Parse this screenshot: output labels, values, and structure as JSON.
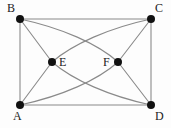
{
  "diagram": {
    "type": "graph-diagram",
    "background_color": "#fdfdfd",
    "edge_color": "#8a8a8a",
    "vertex_color": "#111111",
    "label_color": "#222222",
    "width": 171,
    "height": 128,
    "vertices": [
      {
        "id": "A",
        "label": "A",
        "x": 20,
        "y": 105,
        "radius": 4,
        "label_x": 13,
        "label_y": 110
      },
      {
        "id": "B",
        "label": "B",
        "x": 20,
        "y": 19,
        "radius": 4,
        "label_x": 7,
        "label_y": 2
      },
      {
        "id": "C",
        "label": "C",
        "x": 151,
        "y": 19,
        "radius": 4,
        "label_x": 155,
        "label_y": 2
      },
      {
        "id": "D",
        "label": "D",
        "x": 151,
        "y": 105,
        "radius": 4,
        "label_x": 155,
        "label_y": 110
      },
      {
        "id": "E",
        "label": "E",
        "x": 52,
        "y": 62,
        "radius": 4,
        "label_x": 59,
        "label_y": 56
      },
      {
        "id": "F",
        "label": "F",
        "x": 118,
        "y": 62,
        "radius": 4,
        "label_x": 103,
        "label_y": 56
      }
    ],
    "edges": [
      {
        "id": "edge-b-c",
        "from": "B",
        "to": "C",
        "shape": "straight",
        "path": "M 20 19 L 151 19"
      },
      {
        "id": "edge-a-d",
        "from": "A",
        "to": "D",
        "shape": "straight",
        "path": "M 20 105 L 151 105"
      },
      {
        "id": "edge-a-b",
        "from": "A",
        "to": "B",
        "shape": "straight",
        "path": "M 20 19 L 20 105"
      },
      {
        "id": "edge-c-d",
        "from": "C",
        "to": "D",
        "shape": "straight",
        "path": "M 151 19 L 151 105"
      },
      {
        "id": "edge-b-e",
        "from": "B",
        "to": "E",
        "shape": "straight",
        "path": "M 20 19 L 52 62"
      },
      {
        "id": "edge-a-e",
        "from": "A",
        "to": "E",
        "shape": "straight",
        "path": "M 20 105 L 52 62"
      },
      {
        "id": "edge-c-f",
        "from": "C",
        "to": "F",
        "shape": "straight",
        "path": "M 151 19 L 118 62"
      },
      {
        "id": "edge-d-f",
        "from": "D",
        "to": "F",
        "shape": "straight",
        "path": "M 151 105 L 118 62"
      },
      {
        "id": "edge-b-f",
        "from": "B",
        "to": "F",
        "shape": "curved",
        "path": "M 20 19 C 62 28 98 44 118 62"
      },
      {
        "id": "edge-c-e",
        "from": "C",
        "to": "E",
        "shape": "curved",
        "path": "M 151 19 C 109 28 73 44 52 62"
      },
      {
        "id": "edge-a-f",
        "from": "A",
        "to": "F",
        "shape": "curved",
        "path": "M 20 105 C 62 96 98 80 118 62"
      },
      {
        "id": "edge-d-e",
        "from": "D",
        "to": "E",
        "shape": "curved",
        "path": "M 151 105 C 109 96 73 80 52 62"
      }
    ]
  }
}
